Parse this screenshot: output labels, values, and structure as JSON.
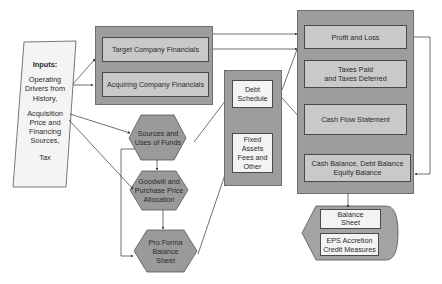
{
  "inputs": {
    "title": "Inputs:",
    "line1": "Operating",
    "line2": "Drivers from",
    "line3": "History,",
    "line4": "Acquisition",
    "line5": "Price and",
    "line6": "Financing",
    "line7": "Sources,",
    "line8": "Tax"
  },
  "financials_group": {
    "target": "Target Company Financials",
    "acquiring": "Acquiring Company Financials"
  },
  "process_steps": {
    "sources_uses_1": "Sources and",
    "sources_uses_2": "Uses of Funds",
    "goodwill_1": "Goodwill and",
    "goodwill_2": "Purchase Price",
    "goodwill_3": "Allocation",
    "pro_forma_1": "Pro Forma",
    "pro_forma_2": "Balance",
    "pro_forma_3": "Sheet"
  },
  "schedules_group": {
    "debt_1": "Debt",
    "debt_2": "Schedule",
    "fixed_1": "Fixed",
    "fixed_2": "Assets",
    "fixed_3": "Fees and",
    "fixed_4": "Other"
  },
  "statements_group": {
    "pnl": "Profit and Loss",
    "taxes_1": "Taxes Paid",
    "taxes_2": "and Taxes Deferred",
    "cfs": "Cash Flow Statement",
    "balances_1": "Cash Balance, Debt Balance",
    "balances_2": "Equity Balance"
  },
  "outputs": {
    "balance_sheet_1": "Balance",
    "balance_sheet_2": "Sheet",
    "eps_1": "EPS Accretion",
    "eps_2": "Credit Measures"
  },
  "colors": {
    "group_fill": "#9d9d9d",
    "inner_fill": "#c9c9c9",
    "hexagon_fill": "#9a9a9a",
    "white_fill": "#f3f3f3",
    "line": "#333333"
  }
}
